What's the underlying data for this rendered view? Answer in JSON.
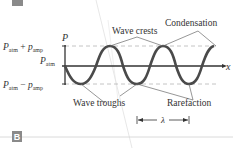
{
  "figure": {
    "panel_a_badge": "A",
    "panel_b_badge": "B",
    "y_axis_label": "P",
    "x_axis_label": "x",
    "levels": {
      "upper": {
        "base": "P",
        "sub1": "atm",
        "op": " + ",
        "base2": "p",
        "sub2": "amp"
      },
      "middle": {
        "base": "P",
        "sub1": "atm"
      },
      "lower": {
        "base": "P",
        "sub1": "atm",
        "op": " − ",
        "base2": "p",
        "sub2": "amp"
      }
    },
    "annotations": {
      "wave_crests": "Wave crests",
      "condensation": "Condensation",
      "wave_troughs": "Wave troughs",
      "rarefaction": "Rarefaction",
      "wavelength": "λ"
    },
    "colors": {
      "wave": "#4a4a4a",
      "axis": "#333333",
      "dashed": "#b0b0b0",
      "leader": "#6a6a6a",
      "badge": "#8a8a8a",
      "divider": "#cfcfcf",
      "background_lines": "#d8d8d8"
    }
  }
}
